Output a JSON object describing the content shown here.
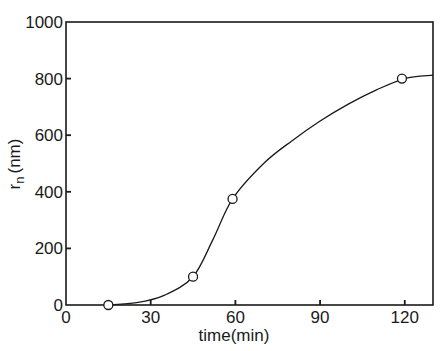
{
  "chart_data": {
    "type": "line",
    "title": "",
    "xlabel": "time(min)",
    "ylabel": "r_n (nm)",
    "ylabel_main": "r",
    "ylabel_sub": "n",
    "ylabel_unit": "(nm)",
    "xlim": [
      0,
      130
    ],
    "ylim": [
      0,
      1000
    ],
    "xticks": [
      0,
      30,
      60,
      90,
      120
    ],
    "yticks": [
      0,
      200,
      400,
      600,
      800,
      1000
    ],
    "xtick_labels": [
      "0",
      "30",
      "60",
      "90",
      "120"
    ],
    "ytick_labels": [
      "0",
      "200",
      "400",
      "600",
      "800",
      "1000"
    ],
    "grid": false,
    "legend": null,
    "series": [
      {
        "name": "measured",
        "marker": "open-circle",
        "x": [
          15,
          45,
          59,
          119
        ],
        "y": [
          0,
          100,
          375,
          800
        ]
      },
      {
        "name": "fitted-curve",
        "marker": "none",
        "x": [
          15,
          25,
          35,
          45,
          52,
          59,
          70,
          80,
          90,
          100,
          110,
          120,
          130
        ],
        "y": [
          0,
          8,
          35,
          100,
          230,
          375,
          500,
          580,
          650,
          710,
          760,
          800,
          812
        ]
      }
    ]
  },
  "colors": {
    "line": "#1a1a1a",
    "background": "#ffffff"
  }
}
